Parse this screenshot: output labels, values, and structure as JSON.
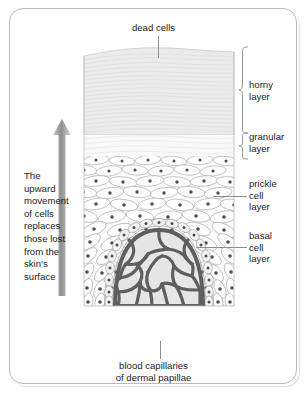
{
  "figure": {
    "title_label": "dead cells",
    "caption": "blood capillaries\nof dermal papillae",
    "side_text": "The\nupward\nmovement\nof cells\nreplaces\nthose lost\nfrom the\nskin's\nsurface",
    "arrow_direction": "up",
    "arrow_name": "upward-arrow-icon"
  },
  "layer_labels": {
    "horny": "horny\nlayer",
    "granular": "granular\nlayer",
    "prickle": "prickle\ncell\nlayer",
    "basal": "basal\ncell\nlayer"
  },
  "colors": {
    "frame_border": "#b9b9b9",
    "text": "#1c1c1c",
    "leader_line": "#8d8d8d",
    "horny_fill": "#ebebeb",
    "granular_fill": "#f7f7f7",
    "prickle_fill": "#fbfbfb",
    "cell_outline": "#9a9a9a",
    "nucleus": "#4a4a4a",
    "capillary_wall": "#6d6d6d",
    "capillary_lumen": "#e6e6e6",
    "arrow_fill": "#9e9e9e",
    "background": "#ffffff"
  }
}
